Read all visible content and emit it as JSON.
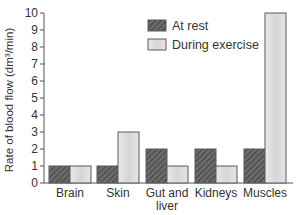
{
  "chart_data": {
    "type": "bar",
    "title": "",
    "xlabel": "",
    "ylabel": "Rate of blood flow (dm³/min)",
    "ylim": [
      0,
      10
    ],
    "yticks": [
      0,
      1,
      2,
      3,
      4,
      5,
      6,
      7,
      8,
      9,
      10
    ],
    "categories": [
      "Brain",
      "Skin",
      "Gut and liver",
      "Kidneys",
      "Muscles"
    ],
    "category_lines": [
      [
        "Brain"
      ],
      [
        "Skin"
      ],
      [
        "Gut and",
        "liver"
      ],
      [
        "Kidneys"
      ],
      [
        "Muscles"
      ]
    ],
    "series": [
      {
        "name": "At rest",
        "values": [
          1,
          1,
          2,
          2,
          2
        ],
        "color": "#5a5a5a",
        "pattern": "hatched"
      },
      {
        "name": "During exercise",
        "values": [
          1,
          3,
          1,
          1,
          10
        ],
        "color": "#dcdcdc",
        "pattern": "light-gradient"
      }
    ],
    "legend_position": "upper-center",
    "grid": false
  }
}
